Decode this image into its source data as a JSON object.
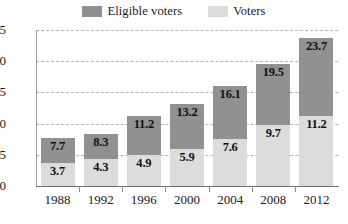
{
  "chart_data": {
    "type": "bar",
    "subtype": "stacked-bar",
    "title": "",
    "xlabel": "",
    "ylabel": "",
    "categories": [
      "1988",
      "1992",
      "1996",
      "2000",
      "2004",
      "2008",
      "2012"
    ],
    "series": [
      {
        "name": "Voters",
        "color": "#dcdcdc",
        "values": [
          3.7,
          4.3,
          4.9,
          5.9,
          7.6,
          9.7,
          11.2
        ]
      },
      {
        "name": "Eligible voters",
        "color": "#919191",
        "values": [
          7.7,
          8.3,
          11.2,
          13.2,
          16.1,
          19.5,
          23.7
        ],
        "note": "labels show cumulative total at top of stack"
      }
    ],
    "stack_totals": [
      7.7,
      8.3,
      11.2,
      13.2,
      16.1,
      19.5,
      23.7
    ],
    "value_labels": {
      "totals": [
        "7.7",
        "8.3",
        "11.2",
        "13.2",
        "16.1",
        "19.5",
        "23.7"
      ],
      "voters": [
        "3.7",
        "4.3",
        "4.9",
        "5.9",
        "7.6",
        "9.7",
        "11.2"
      ]
    },
    "ylim": [
      0,
      25
    ],
    "yticks": [
      0,
      5,
      10,
      15,
      20,
      25
    ],
    "ytick_labels": [
      "0",
      "5",
      "10",
      "15",
      "20",
      "25"
    ],
    "grid": true,
    "grid_style": "dashed-horizontal",
    "legend_position": "top-center"
  },
  "legend": {
    "items": [
      {
        "label": "Eligible voters",
        "swatch": "dark-gray-swatch"
      },
      {
        "label": "Voters",
        "swatch": "light-gray-swatch"
      }
    ]
  },
  "colors": {
    "eligible_voters": "#919191",
    "voters": "#dcdcdc",
    "grid": "#b6b6b6",
    "axis": "#6e6e6e",
    "text": "#1b1b1b",
    "background": "#ffffff"
  }
}
